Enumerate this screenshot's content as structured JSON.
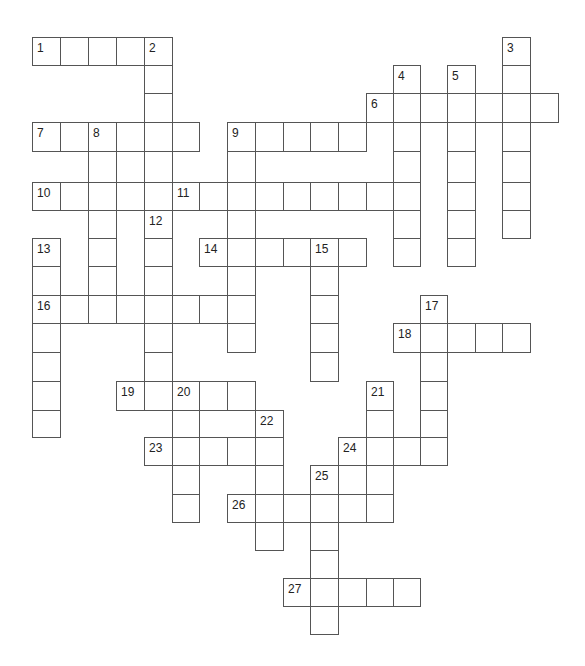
{
  "puzzle": {
    "title": "Crossword",
    "line_color": "#555555",
    "grid": {
      "col_x": [
        32,
        60,
        88,
        116,
        144,
        172,
        199,
        227,
        255,
        283,
        310,
        338,
        366,
        393,
        420,
        447,
        475,
        502,
        530,
        558
      ],
      "row_y": [
        37,
        65,
        93,
        122,
        151,
        182,
        210,
        238,
        266,
        295,
        323,
        352,
        381,
        410,
        437,
        465,
        494,
        522,
        550,
        578,
        606,
        634
      ]
    },
    "entries": [
      {
        "number": "1",
        "direction": "across",
        "row": 0,
        "col": 0,
        "length": 5
      },
      {
        "number": "2",
        "direction": "down",
        "row": 0,
        "col": 4,
        "length": 6
      },
      {
        "number": "3",
        "direction": "down",
        "row": 0,
        "col": 17,
        "length": 7
      },
      {
        "number": "4",
        "direction": "down",
        "row": 1,
        "col": 13,
        "length": 7
      },
      {
        "number": "5",
        "direction": "down",
        "row": 1,
        "col": 15,
        "length": 7
      },
      {
        "number": "6",
        "direction": "across",
        "row": 2,
        "col": 12,
        "length": 7
      },
      {
        "number": "7",
        "direction": "across",
        "row": 3,
        "col": 0,
        "length": 6
      },
      {
        "number": "8",
        "direction": "down",
        "row": 3,
        "col": 2,
        "length": 7
      },
      {
        "number": "9",
        "direction": "across",
        "row": 3,
        "col": 7,
        "length": 5
      },
      {
        "number": "9",
        "direction": "down",
        "row": 3,
        "col": 7,
        "length": 8
      },
      {
        "number": "10",
        "direction": "across",
        "row": 5,
        "col": 0,
        "length": 5
      },
      {
        "number": "11",
        "direction": "across",
        "row": 5,
        "col": 5,
        "length": 9
      },
      {
        "number": "12",
        "direction": "down",
        "row": 6,
        "col": 4,
        "length": 7
      },
      {
        "number": "13",
        "direction": "down",
        "row": 7,
        "col": 0,
        "length": 7
      },
      {
        "number": "14",
        "direction": "across",
        "row": 7,
        "col": 6,
        "length": 6
      },
      {
        "number": "15",
        "direction": "down",
        "row": 7,
        "col": 10,
        "length": 5
      },
      {
        "number": "16",
        "direction": "across",
        "row": 9,
        "col": 0,
        "length": 8
      },
      {
        "number": "17",
        "direction": "down",
        "row": 9,
        "col": 14,
        "length": 6
      },
      {
        "number": "18",
        "direction": "across",
        "row": 10,
        "col": 13,
        "length": 5
      },
      {
        "number": "19",
        "direction": "across",
        "row": 12,
        "col": 3,
        "length": 5
      },
      {
        "number": "20",
        "direction": "down",
        "row": 12,
        "col": 5,
        "length": 5
      },
      {
        "number": "21",
        "direction": "down",
        "row": 12,
        "col": 12,
        "length": 5
      },
      {
        "number": "22",
        "direction": "down",
        "row": 13,
        "col": 8,
        "length": 5
      },
      {
        "number": "23",
        "direction": "across",
        "row": 14,
        "col": 4,
        "length": 5
      },
      {
        "number": "24",
        "direction": "across",
        "row": 14,
        "col": 11,
        "length": 4
      },
      {
        "number": "25",
        "direction": "down",
        "row": 15,
        "col": 10,
        "length": 6
      },
      {
        "number": "26",
        "direction": "across",
        "row": 16,
        "col": 7,
        "length": 6
      },
      {
        "number": "27",
        "direction": "across",
        "row": 19,
        "col": 9,
        "length": 5
      }
    ]
  }
}
